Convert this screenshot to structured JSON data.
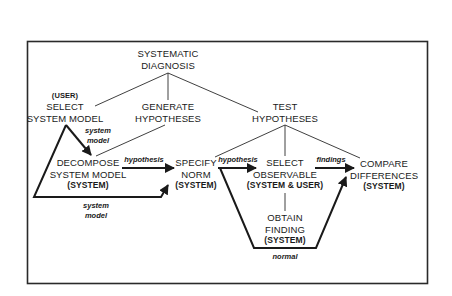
{
  "diagram": {
    "root": {
      "lines": [
        "SYSTEMATIC",
        "DIAGNOSIS"
      ]
    },
    "select_system_model": {
      "actor": "(USER)",
      "lines": [
        "SELECT",
        "SYSTEM MODEL"
      ]
    },
    "generate_hypotheses": {
      "lines": [
        "GENERATE",
        "HYPOTHESES"
      ]
    },
    "test_hypotheses": {
      "lines": [
        "TEST",
        "HYPOTHESES"
      ]
    },
    "decompose_system_model": {
      "lines": [
        "DECOMPOSE",
        "SYSTEM MODEL"
      ],
      "actor": "(SYSTEM)"
    },
    "specify_norm": {
      "lines": [
        "SPECIFY",
        "NORM"
      ],
      "actor": "(SYSTEM)"
    },
    "select_observable": {
      "lines": [
        "SELECT",
        "OBSERVABLE"
      ],
      "actor": "(SYSTEM & USER)"
    },
    "compare_differences": {
      "lines": [
        "COMPARE",
        "DIFFERENCES"
      ],
      "actor": "(SYSTEM)"
    },
    "obtain_finding": {
      "lines": [
        "OBTAIN",
        "FINDING"
      ],
      "actor": "(SYSTEM)"
    },
    "edge_labels": {
      "system_model_top": [
        "system",
        "model"
      ],
      "system_model_bottom": [
        "system",
        "model"
      ],
      "hypothesis_1": "hypothesis",
      "hypothesis_2": "hypothesis",
      "findings": "findings",
      "normal": "normal"
    }
  }
}
